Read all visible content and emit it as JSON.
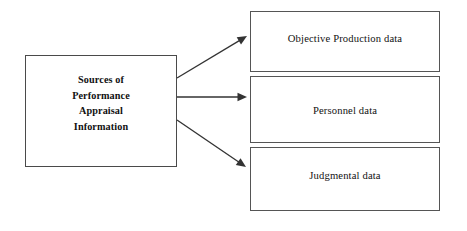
{
  "diagram": {
    "title": "Sources of Performance Appraisal Information",
    "background_color": "#ffffff",
    "line_color": "#333333",
    "box_border_color": "#555555",
    "text_color": "#111111",
    "source_node": {
      "id": "sources-of-performance-appraisal-information",
      "lines": [
        "Sources of",
        "Performance",
        "Appraisal",
        "Information"
      ],
      "text": "Sources of Performance Appraisal Information",
      "bold": true,
      "x": 25,
      "y": 55,
      "width": 152,
      "height": 112
    },
    "target_nodes": [
      {
        "id": "objective-production-data",
        "label": "Objective Production data",
        "x": 250,
        "y": 11,
        "width": 190,
        "height": 61,
        "label_top": 20
      },
      {
        "id": "personnel-data",
        "label": "Personnel data",
        "x": 250,
        "y": 76,
        "width": 190,
        "height": 67,
        "label_top": 27
      },
      {
        "id": "judgmental-data",
        "label": "Judgmental data",
        "x": 250,
        "y": 147,
        "width": 190,
        "height": 64,
        "label_top": 21
      }
    ],
    "connectors": [
      {
        "id": "arrow-to-objective-production-data",
        "from": "sources-of-performance-appraisal-information",
        "to": "objective-production-data",
        "x1": 177,
        "y1": 78,
        "x2": 247,
        "y2": 36,
        "direction": "up-right"
      },
      {
        "id": "arrow-to-personnel-data",
        "from": "sources-of-performance-appraisal-information",
        "to": "personnel-data",
        "x1": 177,
        "y1": 97,
        "x2": 247,
        "y2": 97,
        "direction": "right"
      },
      {
        "id": "arrow-to-judgmental-data",
        "from": "sources-of-performance-appraisal-information",
        "to": "judgmental-data",
        "x1": 177,
        "y1": 120,
        "x2": 246,
        "y2": 167,
        "direction": "down-right"
      }
    ]
  }
}
